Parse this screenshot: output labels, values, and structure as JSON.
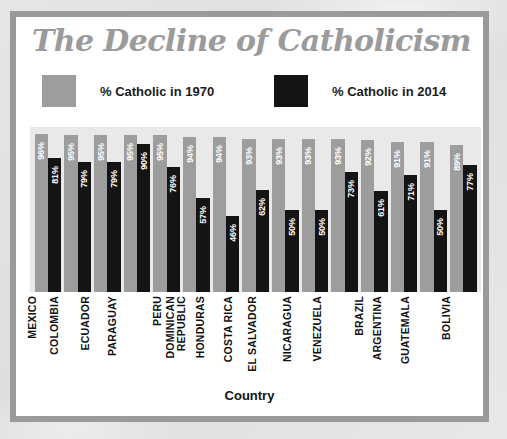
{
  "chart_data": {
    "type": "bar",
    "title": "The Decline of Catholicism",
    "xlabel": "Country",
    "ylabel": "",
    "ylim": [
      0,
      100
    ],
    "grid": false,
    "legend_position": "top",
    "categories": [
      "MEXICO",
      "COLOMBIA",
      "ECUADOR",
      "PARAGUAY",
      "PERU",
      "DOMINICAN REPUBLIC",
      "HONDURAS",
      "COSTA RICA",
      "EL SALVADOR",
      "NICARAGUA",
      "VENEZUELA",
      "BRAZIL",
      "ARGENTINA",
      "GUATEMALA",
      "BOLIVIA"
    ],
    "series": [
      {
        "name": "% Catholic in 1970",
        "color": "#9d9d9d",
        "values": [
          96,
          95,
          95,
          95,
          95,
          94,
          94,
          93,
          93,
          93,
          93,
          92,
          91,
          91,
          89
        ],
        "labels": [
          "96%",
          "95%",
          "95%",
          "95%",
          "95%",
          "94%",
          "94%",
          "93%",
          "93%",
          "93%",
          "93%",
          "92%",
          "91%",
          "91%",
          "89%"
        ]
      },
      {
        "name": "% Catholic in 2014",
        "color": "#141414",
        "values": [
          81,
          79,
          79,
          90,
          76,
          57,
          46,
          62,
          50,
          50,
          73,
          61,
          71,
          50,
          77
        ],
        "labels": [
          "81%",
          "79%",
          "79%",
          "90%",
          "76%",
          "57%",
          "46%",
          "62%",
          "50%",
          "50%",
          "73%",
          "61%",
          "71%",
          "50%",
          "77%"
        ]
      }
    ]
  },
  "category_lines": [
    [
      "MEXICO"
    ],
    [
      "COLOMBIA"
    ],
    [
      "ECUADOR"
    ],
    [
      "PARAGUAY"
    ],
    [
      "PERU"
    ],
    [
      "DOMINICAN",
      "REPUBLIC"
    ],
    [
      "HONDURAS"
    ],
    [
      "COSTA RICA"
    ],
    [
      "EL SALVADOR"
    ],
    [
      "NICARAGUA"
    ],
    [
      "VENEZUELA"
    ],
    [
      "BRAZIL"
    ],
    [
      "ARGENTINA"
    ],
    [
      "GUATEMALA"
    ],
    [
      "BOLIVIA"
    ]
  ],
  "legend": [
    {
      "label": "% Catholic in 1970",
      "color": "#9d9d9d"
    },
    {
      "label": "% Catholic in 2014",
      "color": "#141414"
    }
  ],
  "colors": {
    "title": "#9b9b9b",
    "frame": "#9a9a9a",
    "plot_background": "#e9e9e9",
    "card_background": "#ffffff",
    "bar_1970": "#9d9d9d",
    "bar_2014": "#141414",
    "value_text": "#ffffff",
    "axis_text": "#111111"
  }
}
